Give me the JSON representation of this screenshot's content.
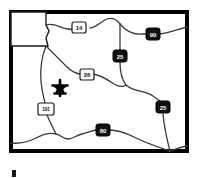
{
  "map": {
    "title": "Wyoming state highway map",
    "state": "Wyoming",
    "background_color": "#ffffff",
    "border_color": "#000000",
    "road_color": "#3a3a3a",
    "frame": {
      "x": 11,
      "y": 12,
      "width": 176,
      "height": 139
    },
    "park_notch": {
      "name": "Yellowstone National Park",
      "x": 11,
      "y": 12,
      "width": 35,
      "height": 35
    },
    "marker": {
      "type": "star",
      "label": "location-star",
      "x": 60,
      "y": 88,
      "color": "#000000",
      "size": 13
    },
    "bottom_tick": {
      "x": 12,
      "y": 170,
      "width": 4,
      "height": 7,
      "color": "#1a1a1a"
    },
    "shields": [
      {
        "id": "us-14",
        "number": "14",
        "type": "us",
        "x": 79,
        "y": 28,
        "fill": "#ffffff",
        "text": "#111111"
      },
      {
        "id": "i-90",
        "number": "90",
        "type": "interstate",
        "x": 153,
        "y": 34,
        "fill": "#111111",
        "text": "#ffffff"
      },
      {
        "id": "i-25-n",
        "number": "25",
        "type": "interstate",
        "x": 120,
        "y": 56,
        "fill": "#111111",
        "text": "#ffffff"
      },
      {
        "id": "us-26",
        "number": "26",
        "type": "us",
        "x": 87,
        "y": 74,
        "fill": "#ffffff",
        "text": "#111111"
      },
      {
        "id": "i-25-s",
        "number": "25",
        "type": "interstate",
        "x": 163,
        "y": 107,
        "fill": "#111111",
        "text": "#ffffff"
      },
      {
        "id": "us-191",
        "number": "191",
        "type": "us",
        "x": 46,
        "y": 109,
        "fill": "#ffffff",
        "text": "#111111"
      },
      {
        "id": "i-80",
        "number": "80",
        "type": "interstate",
        "x": 103,
        "y": 130,
        "fill": "#111111",
        "text": "#ffffff"
      }
    ],
    "roads": [
      {
        "id": "us-14-route",
        "name": "US 14 northern route"
      },
      {
        "id": "i-90-route",
        "name": "Interstate 90 route"
      },
      {
        "id": "i-25-route",
        "name": "Interstate 25 route"
      },
      {
        "id": "us-26-route",
        "name": "US 26 central route"
      },
      {
        "id": "us-191-route",
        "name": "US 191 western route"
      },
      {
        "id": "i-80-route",
        "name": "Interstate 80 southern route"
      }
    ]
  }
}
